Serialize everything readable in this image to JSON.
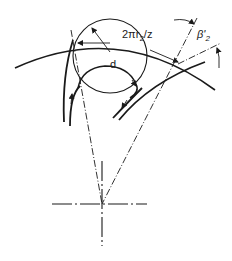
{
  "diagram": {
    "type": "impeller blade geometry",
    "labels": {
      "pitch": "2πr",
      "pitch_sub": "2",
      "pitch_tail": "/z",
      "diameter": "d",
      "angle": "β'",
      "angle_sub": "2"
    },
    "colors": {
      "stroke": "#1a1a1a",
      "background": "#ffffff"
    }
  }
}
